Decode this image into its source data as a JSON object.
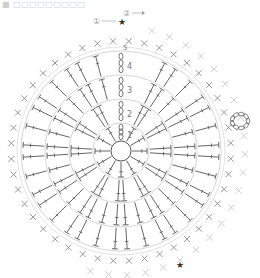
{
  "caption": "■ □□□□□□□□□",
  "diagram": {
    "type": "crochet-round-chart",
    "center": {
      "x": 121,
      "y": 151
    },
    "ring_radii": [
      10,
      28,
      52,
      76,
      100
    ],
    "round_labels": [
      "1",
      "2",
      "3",
      "4",
      "5"
    ],
    "markers": {
      "label_1": "①",
      "label_2": "②",
      "star": "★"
    },
    "colors": {
      "line": "#555555",
      "ring": "#cfcfcf",
      "outer_x": "#8a8a8a",
      "faint_x": "#c8c8c8"
    },
    "stitch_symbols": {
      "chain": "oval",
      "single_crochet": "x",
      "double_crochet": "T-crossbar",
      "increase": "V"
    }
  }
}
